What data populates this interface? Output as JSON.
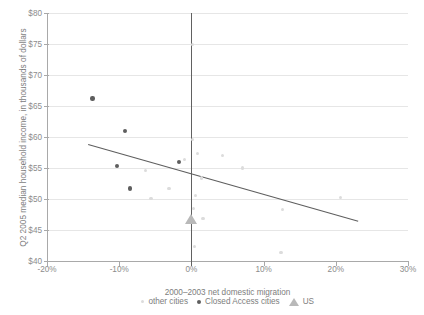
{
  "chart_data": {
    "type": "scatter",
    "title": "",
    "xlabel": "2000–2003 net domestic migration",
    "ylabel": "Q2 2005 median household income, in thousands of dollars",
    "xlim": [
      -20,
      30
    ],
    "ylim": [
      40,
      80
    ],
    "xticks": [
      "-20%",
      "-10%",
      "0%",
      "10%",
      "20%",
      "30%"
    ],
    "xtick_values": [
      -20,
      -10,
      0,
      10,
      20,
      30
    ],
    "yticks": [
      "$40",
      "$45",
      "$50",
      "$55",
      "$60",
      "$65",
      "$70",
      "$75",
      "$80"
    ],
    "ytick_values": [
      40,
      45,
      50,
      55,
      60,
      65,
      70,
      75,
      80
    ],
    "grid": "horizontal",
    "legend_position": "bottom",
    "zero_reference_line": 0,
    "series": [
      {
        "name": "other cities",
        "marker": "circle",
        "color": "#dcdcdc",
        "points": [
          [
            0.1,
            74.9
          ],
          [
            0.2,
            59.6
          ],
          [
            0.9,
            57.3
          ],
          [
            -1.0,
            56.4
          ],
          [
            -6.4,
            54.6
          ],
          [
            1.4,
            53.4
          ],
          [
            4.3,
            57.0
          ],
          [
            -5.6,
            50.1
          ],
          [
            -3.1,
            51.7
          ],
          [
            0.6,
            50.6
          ],
          [
            7.1,
            55.0
          ],
          [
            0.3,
            48.5
          ],
          [
            1.6,
            46.8
          ],
          [
            20.6,
            50.2
          ],
          [
            12.6,
            48.3
          ],
          [
            0.4,
            42.3
          ],
          [
            12.4,
            41.4
          ]
        ]
      },
      {
        "name": "Closed Access cities",
        "marker": "circle",
        "color": "#5e5e5e",
        "points": [
          [
            -13.7,
            66.2
          ],
          [
            -9.2,
            61.0
          ],
          [
            -1.7,
            56.0
          ],
          [
            -10.3,
            55.3
          ],
          [
            -8.5,
            51.7
          ]
        ]
      },
      {
        "name": "US",
        "marker": "triangle",
        "color": "#b9b9b9",
        "points": [
          [
            0.0,
            46.1
          ]
        ]
      }
    ],
    "trendline": {
      "color": "#5e5e5e",
      "x_start": -14.3,
      "y_start": 58.8,
      "x_end": 23.1,
      "y_end": 46.4
    }
  }
}
